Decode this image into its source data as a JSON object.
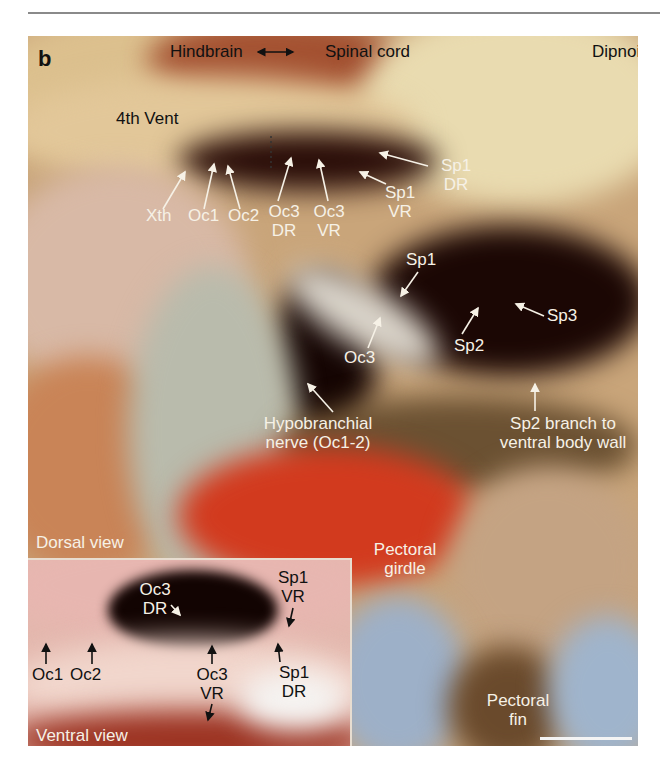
{
  "figure": {
    "panel_letter": "b",
    "taxon": "Dipnoi",
    "orientation_label": {
      "left": "Hindbrain",
      "right": "Spinal cord",
      "arrow": "double-headed"
    },
    "labels": {
      "fourth_ventricle": "4th Vent",
      "xth": "Xth",
      "oc1": "Oc1",
      "oc2": "Oc2",
      "oc3_dr": [
        "Oc3",
        "DR"
      ],
      "oc3_vr": [
        "Oc3",
        "VR"
      ],
      "sp1_vr": [
        "Sp1",
        "VR"
      ],
      "sp1_dr": [
        "Sp1",
        "DR"
      ],
      "sp1": "Sp1",
      "sp2": "Sp2",
      "sp3": "Sp3",
      "oc3": "Oc3",
      "hypobranchial": [
        "Hypobranchial",
        "nerve (Oc1-2)"
      ],
      "sp2_branch": [
        "Sp2 branch to",
        "ventral body wall"
      ],
      "pectoral_girdle": [
        "Pectoral",
        "girdle"
      ],
      "pectoral_fin": [
        "Pectoral",
        "fin"
      ],
      "dorsal_view": "Dorsal view"
    },
    "inset": {
      "view": "Ventral view",
      "labels": {
        "oc3_dr": [
          "Oc3",
          "DR"
        ],
        "sp1_vr": [
          "Sp1",
          "VR"
        ],
        "oc1": "Oc1",
        "oc2": "Oc2",
        "oc3_vr": [
          "Oc3",
          "VR"
        ],
        "sp1_dr": [
          "Sp1",
          "DR"
        ]
      }
    },
    "scale_bar": {
      "visible": true,
      "color": "#f4f4f4"
    },
    "colors": {
      "label_light": "#f6f1e6",
      "label_dark": "#111111",
      "rule": "#8a8a8a"
    }
  }
}
